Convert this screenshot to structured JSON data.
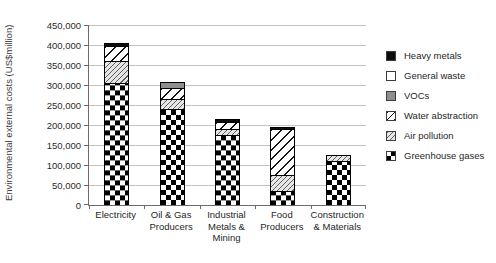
{
  "chart_data": {
    "type": "bar",
    "stacked": true,
    "title": "",
    "xlabel": "",
    "ylabel": "Environmental external costs (US$million)",
    "ylim": [
      0,
      450000
    ],
    "ytick_step": 50000,
    "grid": true,
    "legend_position": "right",
    "axis_color": "#6b6b6b",
    "gridline_color": "#c3c3c3",
    "categories": [
      "Electricity",
      "Oil & Gas\nProducers",
      "Industrial\nMetals &\nMining",
      "Food\nProducers",
      "Construction\n& Materials"
    ],
    "category_slugs": [
      "electricity",
      "oil-gas-producers",
      "industrial-metals-mining",
      "food-producers",
      "construction-materials"
    ],
    "series": [
      {
        "name": "Greenhouse gases",
        "key": "greenhouse_gases",
        "pattern": "checkerboard",
        "values": [
          306000,
          240000,
          176000,
          36000,
          110000
        ]
      },
      {
        "name": "Air pollution",
        "key": "air_pollution",
        "pattern": "fine-diagonal-hatch",
        "values": [
          55000,
          25000,
          13000,
          38000,
          15000
        ]
      },
      {
        "name": "Water abstraction",
        "key": "water_abstraction",
        "pattern": "wide-diagonal-hatch",
        "values": [
          36000,
          27000,
          18000,
          117000,
          0
        ]
      },
      {
        "name": "VOCs",
        "key": "vocs",
        "pattern": "solid-gray",
        "values": [
          0,
          15000,
          0,
          0,
          0
        ]
      },
      {
        "name": "General waste",
        "key": "general_waste",
        "pattern": "solid-white",
        "values": [
          0,
          0,
          0,
          0,
          0
        ]
      },
      {
        "name": "Heavy metals",
        "key": "heavy_metals",
        "pattern": "solid-black",
        "values": [
          7000,
          0,
          8000,
          5000,
          0
        ]
      }
    ],
    "totals": [
      404000,
      307000,
      215000,
      196000,
      125000
    ],
    "legend": [
      {
        "label": "Heavy metals",
        "key": "heavy_metals"
      },
      {
        "label": "General waste",
        "key": "general_waste"
      },
      {
        "label": "VOCs",
        "key": "vocs"
      },
      {
        "label": "Water abstraction",
        "key": "water_abstraction"
      },
      {
        "label": "Air pollution",
        "key": "air_pollution"
      },
      {
        "label": "Greenhouse gases",
        "key": "greenhouse_gases"
      }
    ]
  }
}
